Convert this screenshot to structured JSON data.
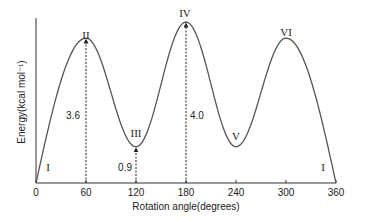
{
  "chart_data": {
    "type": "line",
    "title": "",
    "xlabel": "Rotation angle(degrees)",
    "ylabel": "Energy(kcal mol⁻¹)",
    "xlim": [
      0,
      360
    ],
    "ylim": [
      0,
      4.0
    ],
    "xticks": [
      0,
      60,
      120,
      180,
      240,
      300,
      360
    ],
    "yticks": [],
    "grid": false,
    "legend": "none",
    "series": [
      {
        "name": "energy",
        "x": [
          0,
          60,
          120,
          180,
          240,
          300,
          360
        ],
        "y": [
          0,
          3.6,
          0.9,
          4.0,
          0.9,
          3.6,
          0
        ]
      }
    ],
    "point_labels": [
      {
        "x": 15,
        "label": "I",
        "pos": "low"
      },
      {
        "x": 60,
        "label": "II",
        "pos": "top"
      },
      {
        "x": 120,
        "label": "III",
        "pos": "above-min"
      },
      {
        "x": 180,
        "label": "IV",
        "pos": "top"
      },
      {
        "x": 240,
        "label": "V",
        "pos": "above-min"
      },
      {
        "x": 345,
        "label": "I",
        "pos": "low"
      }
    ],
    "extra_label": {
      "x": 300,
      "label": "VI"
    },
    "annotations": [
      {
        "x": 60,
        "value": 3.6,
        "text": "3.6"
      },
      {
        "x": 120,
        "value": 0.9,
        "text": "0.9"
      },
      {
        "x": 180,
        "value": 4.0,
        "text": "4.0"
      }
    ]
  }
}
